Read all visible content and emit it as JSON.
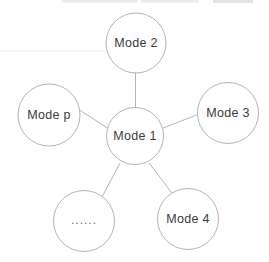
{
  "diagram": {
    "type": "star-graph",
    "center_node": {
      "id": "mode-1",
      "label": "Mode 1"
    },
    "satellite_nodes": [
      {
        "id": "mode-2",
        "label": "Mode 2",
        "position": "top"
      },
      {
        "id": "mode-3",
        "label": "Mode 3",
        "position": "right"
      },
      {
        "id": "mode-4",
        "label": "Mode 4",
        "position": "bottom-right"
      },
      {
        "id": "ellipsis-node",
        "label": "......",
        "position": "bottom-left"
      },
      {
        "id": "mode-p",
        "label": "Mode p",
        "position": "left"
      }
    ],
    "edges": [
      {
        "from": "Mode 1",
        "to": "Mode 2"
      },
      {
        "from": "Mode 1",
        "to": "Mode p"
      },
      {
        "from": "Mode 1",
        "to": "Mode 3"
      },
      {
        "from": "Mode 1",
        "to": "......"
      },
      {
        "from": "Mode 1",
        "to": "Mode 4"
      }
    ],
    "colors": {
      "background": "#ffffff",
      "node_fill": "#ffffff",
      "node_stroke": "#b5b5b5",
      "edge": "#b5b5b5",
      "label": "#3a3a3a",
      "ellipsis_label": "#6f6f6f",
      "top_artifact": "#ececec"
    }
  }
}
